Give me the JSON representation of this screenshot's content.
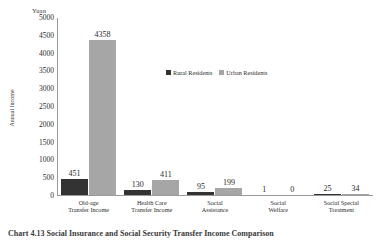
{
  "chart_data": {
    "type": "bar",
    "title": "",
    "subtitle": "",
    "xlabel": "",
    "ylabel": "Annual Income",
    "yunit": "Yuan",
    "ylim": [
      0,
      5000
    ],
    "ytick_step": 500,
    "yticks": [
      "5000",
      "4500",
      "4000",
      "3500",
      "3000",
      "2500",
      "2000",
      "1500",
      "1000",
      "500",
      "0"
    ],
    "grid": false,
    "legend_position": "inside-upper-right",
    "categories": [
      "Old-age Transfer Income",
      "Health Care Transfer Income",
      "Social Assistance",
      "Social Welfare",
      "Social Special Treatment"
    ],
    "category_lines": [
      [
        "Old-age",
        "Transfer Income"
      ],
      [
        "Health Care",
        "Transfer Income"
      ],
      [
        "Social",
        "Assistance"
      ],
      [
        "Social",
        "Welfare"
      ],
      [
        "Social Special",
        "Treatment"
      ]
    ],
    "series": [
      {
        "name": "Rural Residents",
        "color": "#333333",
        "values": [
          451,
          130,
          95,
          1,
          25
        ]
      },
      {
        "name": "Urban Residents",
        "color": "#a6a6a6",
        "values": [
          4358,
          411,
          199,
          0,
          34
        ]
      }
    ]
  },
  "legend": {
    "items": [
      {
        "label": "Rural Residents",
        "color": "#333333"
      },
      {
        "label": "Urban Residents",
        "color": "#a6a6a6"
      }
    ]
  },
  "caption": {
    "text": "Chart 4.13  Social Insurance and Social Security Transfer Income Comparison"
  },
  "colors": {
    "rural": "#333333",
    "urban": "#a6a6a6",
    "axis": "#9a9a9a",
    "text": "#2b2b2b",
    "background": "#ffffff"
  }
}
